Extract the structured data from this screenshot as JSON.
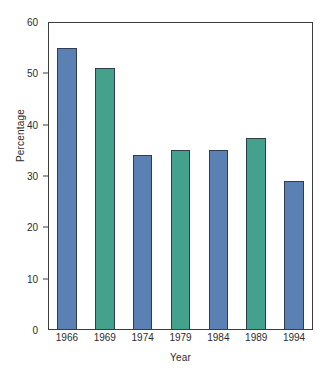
{
  "chart_data": {
    "type": "bar",
    "title": "",
    "xlabel": "Year",
    "ylabel": "Percentage",
    "categories": [
      "1966",
      "1969",
      "1974",
      "1979",
      "1984",
      "1989",
      "1994"
    ],
    "values": [
      55,
      51,
      34,
      35,
      35,
      37.5,
      29
    ],
    "series": [
      {
        "name": "Percentage",
        "values": [
          55,
          51,
          34,
          35,
          35,
          37.5,
          29
        ]
      }
    ],
    "bar_colors": [
      "#5b80b4",
      "#44a18c",
      "#5b80b4",
      "#44a18c",
      "#5b80b4",
      "#44a18c",
      "#5b80b4"
    ],
    "bar_edge_color": "#2f3d4f",
    "ylim": [
      0,
      60
    ],
    "xlim_note": "categorical",
    "yticks": [
      0,
      10,
      20,
      30,
      40,
      50,
      60
    ],
    "ytick_labels": [
      "0",
      "10",
      "20",
      "30",
      "40",
      "50",
      "60"
    ],
    "grid": false,
    "legend": null,
    "legend_position": "none",
    "annotations": [],
    "axis_color": "#3d3d3d",
    "background_color": "#ffffff",
    "text_color": "#2b2b2b"
  }
}
